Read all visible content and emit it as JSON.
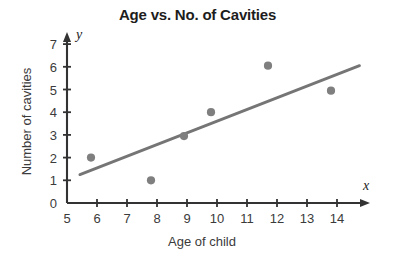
{
  "chart_data": {
    "type": "scatter",
    "title": "Age vs. No. of Cavities",
    "xlabel": "Age of child",
    "ylabel": "Number of cavities",
    "x_axis_variable": "x",
    "y_axis_variable": "y",
    "xlim": [
      5,
      15
    ],
    "ylim": [
      0,
      7.4
    ],
    "grid": false,
    "legend": null,
    "x_ticks": [
      5,
      6,
      7,
      8,
      9,
      10,
      11,
      12,
      13,
      14
    ],
    "x_tick_labels": [
      "5",
      "6",
      "7",
      "8",
      "9",
      "10",
      "11",
      "12",
      "13",
      "14"
    ],
    "y_ticks": [
      0,
      1,
      2,
      3,
      4,
      5,
      6,
      7
    ],
    "y_tick_labels": [
      "0",
      "1",
      "2",
      "3",
      "4",
      "5",
      "6",
      "7"
    ],
    "points": [
      {
        "x": 5.8,
        "y": 2.0
      },
      {
        "x": 7.8,
        "y": 1.0
      },
      {
        "x": 8.9,
        "y": 2.95
      },
      {
        "x": 9.8,
        "y": 4.0
      },
      {
        "x": 11.7,
        "y": 6.05
      },
      {
        "x": 13.8,
        "y": 4.95
      }
    ],
    "trend_line": {
      "name": "line of best fit",
      "x_start": 5.43,
      "y_start": 1.25,
      "x_end": 14.75,
      "y_end": 6.05
    },
    "colors": {
      "point": "#7f7f7f",
      "line": "#757575",
      "axis": "#333333",
      "text": "#3b3b3b",
      "title": "#1d1d1d",
      "background": "#ffffff"
    }
  }
}
